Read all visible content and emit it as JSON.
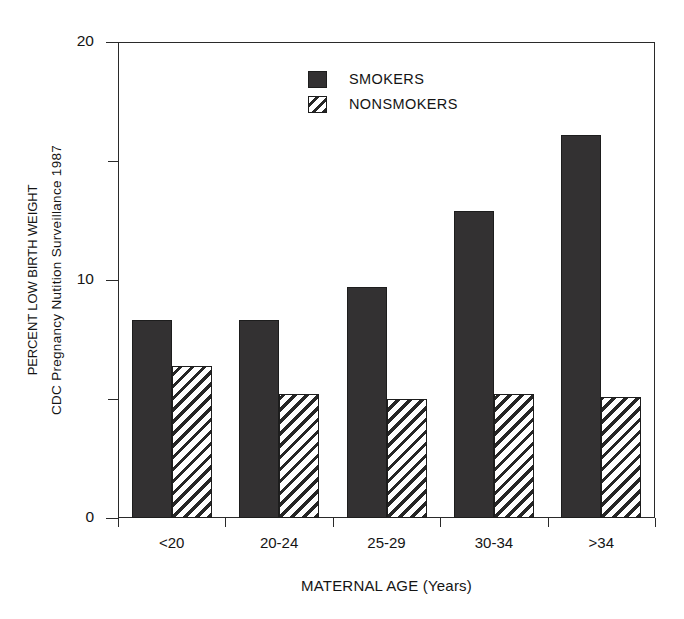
{
  "chart_data": {
    "type": "bar",
    "title": "",
    "xlabel": "MATERNAL AGE (Years)",
    "ylabel_line1": "PERCENT LOW BIRTH WEIGHT",
    "ylabel_line2": "CDC Pregnancy Nutition Surveillance 1987",
    "categories": [
      "<20",
      "20-24",
      "25-29",
      "30-34",
      ">34"
    ],
    "series": [
      {
        "name": "SMOKERS",
        "color": "#333132",
        "fill": "solid",
        "values": [
          8.3,
          8.3,
          9.7,
          12.9,
          16.1
        ]
      },
      {
        "name": "NONSMOKERS",
        "color": "#262626",
        "fill": "diagonal-hatch",
        "values": [
          6.4,
          5.2,
          5.0,
          5.2,
          5.1
        ]
      }
    ],
    "ylim": [
      0,
      20
    ],
    "y_major_ticks": [
      0,
      10,
      20
    ],
    "y_major_tick_labels": [
      "0",
      "10",
      "20"
    ],
    "y_minor_ticks": [
      5,
      15
    ],
    "grid": false,
    "legend_position": "top-center"
  },
  "legend": {
    "entries": [
      {
        "label": "SMOKERS"
      },
      {
        "label": "NONSMOKERS"
      }
    ]
  },
  "axes": {
    "y_title_line1": "PERCENT LOW BIRTH WEIGHT",
    "y_title_line2": "CDC Pregnancy Nutition Surveillance 1987",
    "x_title": "MATERNAL AGE (Years)",
    "y_tick_0": "0",
    "y_tick_10": "10",
    "y_tick_20": "20",
    "x_tick_0": "<20",
    "x_tick_1": "20-24",
    "x_tick_2": "25-29",
    "x_tick_3": "30-34",
    "x_tick_4": ">34"
  }
}
